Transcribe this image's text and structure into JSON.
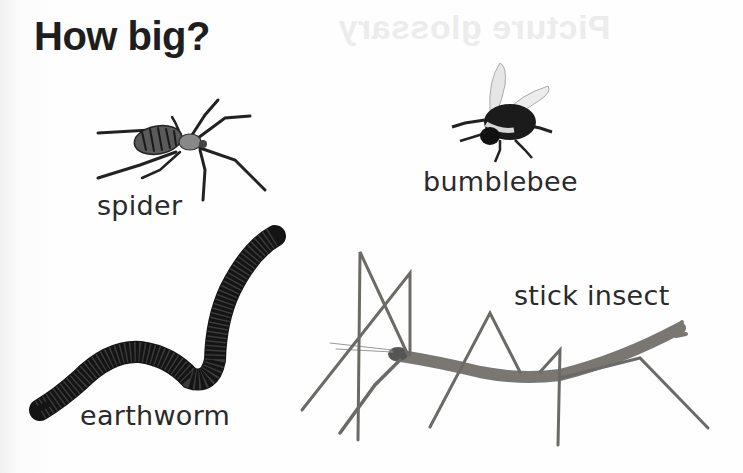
{
  "page": {
    "title": "How big?",
    "ghost_title": "Picture glossary",
    "background_color": "#fdfdfd"
  },
  "animals": [
    {
      "name": "spider",
      "label": "spider",
      "image": "spider-photo"
    },
    {
      "name": "bumblebee",
      "label": "bumblebee",
      "image": "bumblebee-photo"
    },
    {
      "name": "earthworm",
      "label": "earthworm",
      "image": "earthworm-photo"
    },
    {
      "name": "stick-insect",
      "label": "stick insect",
      "image": "stick-insect-photo"
    }
  ]
}
